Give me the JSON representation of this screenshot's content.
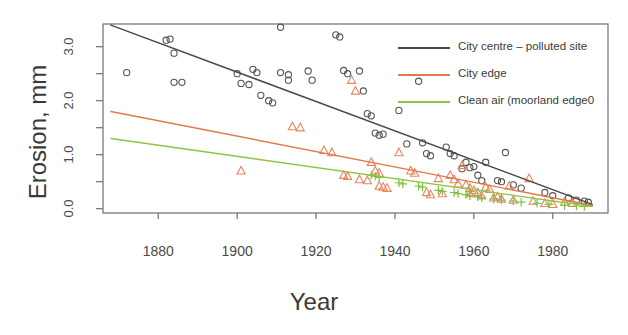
{
  "chart_data": {
    "type": "scatter",
    "title": "",
    "xlabel": "Year",
    "ylabel": "Erosion, mm",
    "xlim": [
      1866,
      1994
    ],
    "ylim": [
      -0.08,
      3.42
    ],
    "xticks": [
      1880,
      1900,
      1920,
      1940,
      1960,
      1980
    ],
    "xticklabels": [
      "1880",
      "1900",
      "1920",
      "1940",
      "1960",
      "1980"
    ],
    "yticks": [
      0.0,
      0.5,
      1.0,
      1.5,
      2.0,
      2.5,
      3.0
    ],
    "yticklabels": [
      "0.0",
      "",
      "1.0",
      "",
      "2.0",
      "",
      "3.0"
    ],
    "ytick_major": [
      0.0,
      1.0,
      2.0,
      3.0
    ],
    "grid": false,
    "legend_position": "top-right",
    "series": [
      {
        "name": "City centre – polluted site",
        "color": "#4a4a4a",
        "marker": "circle",
        "marker_color": "#555555",
        "trend": {
          "x": [
            1868,
            1990
          ],
          "y": [
            3.4,
            0.08
          ]
        },
        "points": [
          [
            1872,
            2.52
          ],
          [
            1882,
            3.12
          ],
          [
            1883,
            3.14
          ],
          [
            1884,
            2.88
          ],
          [
            1884,
            2.34
          ],
          [
            1886,
            2.34
          ],
          [
            1900,
            2.5
          ],
          [
            1901,
            2.32
          ],
          [
            1903,
            2.3
          ],
          [
            1904,
            2.58
          ],
          [
            1905,
            2.52
          ],
          [
            1906,
            2.1
          ],
          [
            1908,
            2.0
          ],
          [
            1909,
            1.96
          ],
          [
            1911,
            3.36
          ],
          [
            1911,
            2.52
          ],
          [
            1913,
            2.48
          ],
          [
            1913,
            2.38
          ],
          [
            1918,
            2.55
          ],
          [
            1919,
            2.38
          ],
          [
            1925,
            3.22
          ],
          [
            1926,
            3.18
          ],
          [
            1927,
            2.56
          ],
          [
            1928,
            2.5
          ],
          [
            1931,
            2.55
          ],
          [
            1932,
            2.18
          ],
          [
            1933,
            1.76
          ],
          [
            1934,
            1.72
          ],
          [
            1935,
            1.4
          ],
          [
            1936,
            1.36
          ],
          [
            1937,
            1.38
          ],
          [
            1941,
            1.82
          ],
          [
            1943,
            1.2
          ],
          [
            1946,
            2.36
          ],
          [
            1947,
            1.22
          ],
          [
            1948,
            1.02
          ],
          [
            1949,
            0.98
          ],
          [
            1953,
            1.14
          ],
          [
            1954,
            1.02
          ],
          [
            1955,
            0.98
          ],
          [
            1957,
            0.74
          ],
          [
            1958,
            0.86
          ],
          [
            1959,
            0.76
          ],
          [
            1960,
            0.78
          ],
          [
            1961,
            0.62
          ],
          [
            1962,
            0.52
          ],
          [
            1963,
            0.86
          ],
          [
            1966,
            0.52
          ],
          [
            1967,
            0.5
          ],
          [
            1968,
            1.04
          ],
          [
            1970,
            0.44
          ],
          [
            1972,
            0.38
          ],
          [
            1978,
            0.3
          ],
          [
            1980,
            0.24
          ],
          [
            1984,
            0.2
          ],
          [
            1986,
            0.16
          ],
          [
            1988,
            0.14
          ],
          [
            1989,
            0.12
          ]
        ]
      },
      {
        "name": "City edge",
        "color": "#e2794b",
        "marker": "triangle",
        "marker_color": "#e8865e",
        "trend": {
          "x": [
            1868,
            1990
          ],
          "y": [
            1.8,
            0.06
          ]
        },
        "points": [
          [
            1901,
            0.7
          ],
          [
            1914,
            1.52
          ],
          [
            1916,
            1.5
          ],
          [
            1922,
            1.08
          ],
          [
            1924,
            1.04
          ],
          [
            1927,
            0.62
          ],
          [
            1928,
            0.6
          ],
          [
            1929,
            2.38
          ],
          [
            1930,
            2.18
          ],
          [
            1931,
            0.54
          ],
          [
            1933,
            0.52
          ],
          [
            1934,
            0.86
          ],
          [
            1935,
            0.7
          ],
          [
            1936,
            0.66
          ],
          [
            1936,
            0.42
          ],
          [
            1937,
            0.4
          ],
          [
            1938,
            0.38
          ],
          [
            1941,
            1.04
          ],
          [
            1944,
            0.7
          ],
          [
            1945,
            0.66
          ],
          [
            1948,
            0.3
          ],
          [
            1949,
            0.26
          ],
          [
            1951,
            0.56
          ],
          [
            1952,
            0.28
          ],
          [
            1954,
            0.62
          ],
          [
            1955,
            0.54
          ],
          [
            1956,
            0.46
          ],
          [
            1957,
            0.8
          ],
          [
            1958,
            0.44
          ],
          [
            1959,
            0.38
          ],
          [
            1959,
            0.28
          ],
          [
            1960,
            0.34
          ],
          [
            1961,
            0.3
          ],
          [
            1962,
            0.24
          ],
          [
            1963,
            0.4
          ],
          [
            1964,
            0.36
          ],
          [
            1965,
            0.2
          ],
          [
            1966,
            0.22
          ],
          [
            1967,
            0.18
          ],
          [
            1969,
            0.42
          ],
          [
            1970,
            0.16
          ],
          [
            1974,
            0.56
          ],
          [
            1975,
            0.14
          ],
          [
            1978,
            0.1
          ],
          [
            1980,
            0.08
          ],
          [
            1983,
            0.12
          ],
          [
            1985,
            0.1
          ]
        ]
      },
      {
        "name": "Clean air (moorland edge0",
        "color": "#8cc63f",
        "marker": "plus",
        "marker_color": "#7dc242",
        "trend": {
          "x": [
            1868,
            1990
          ],
          "y": [
            1.3,
            0.04
          ]
        },
        "points": [
          [
            1934,
            0.62
          ],
          [
            1935,
            0.6
          ],
          [
            1936,
            0.58
          ],
          [
            1941,
            0.48
          ],
          [
            1942,
            0.46
          ],
          [
            1946,
            0.42
          ],
          [
            1947,
            0.4
          ],
          [
            1951,
            0.34
          ],
          [
            1952,
            0.32
          ],
          [
            1955,
            0.3
          ],
          [
            1956,
            0.28
          ],
          [
            1958,
            0.26
          ],
          [
            1959,
            0.24
          ],
          [
            1961,
            0.22
          ],
          [
            1962,
            0.2
          ],
          [
            1965,
            0.18
          ],
          [
            1967,
            0.16
          ],
          [
            1970,
            0.14
          ],
          [
            1972,
            0.12
          ],
          [
            1976,
            0.1
          ],
          [
            1979,
            0.08
          ],
          [
            1983,
            0.06
          ],
          [
            1986,
            0.05
          ],
          [
            1988,
            0.04
          ]
        ]
      }
    ],
    "legend": [
      {
        "label": "City centre – polluted site",
        "color": "#4a4a4a"
      },
      {
        "label": "City edge",
        "color": "#e2794b"
      },
      {
        "label": "Clean air (moorland edge0",
        "color": "#8cc63f"
      }
    ]
  }
}
